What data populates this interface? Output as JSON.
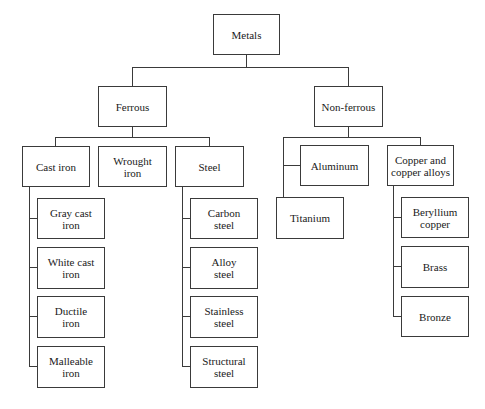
{
  "diagram": {
    "root": {
      "label": "Metals"
    },
    "level1": [
      {
        "label": "Ferrous"
      },
      {
        "label": "Non-ferrous"
      }
    ],
    "ferrous": [
      {
        "label": "Cast iron"
      },
      {
        "label": "Wrought iron"
      },
      {
        "label": "Steel"
      }
    ],
    "cast_iron": [
      {
        "label": "Gray cast iron"
      },
      {
        "label": "White cast iron"
      },
      {
        "label": "Ductile iron"
      },
      {
        "label": "Malleable iron"
      }
    ],
    "steel": [
      {
        "label": "Carbon steel"
      },
      {
        "label": "Alloy steel"
      },
      {
        "label": "Stainless steel"
      },
      {
        "label": "Structural steel"
      }
    ],
    "non_ferrous": [
      {
        "label": "Aluminum"
      },
      {
        "label": "Titanium"
      },
      {
        "label": "Copper and copper alloys"
      }
    ],
    "copper": [
      {
        "label": "Beryllium copper"
      },
      {
        "label": "Brass"
      },
      {
        "label": "Bronze"
      }
    ]
  }
}
